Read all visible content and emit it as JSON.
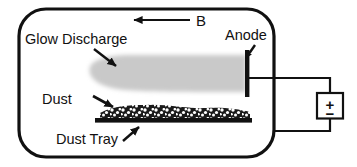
{
  "figure": {
    "background_color": "#ffffff",
    "line_color": "#111111",
    "glow_color": "#c9c9c9",
    "dust_color": "#1a1a1a"
  },
  "labels": {
    "glow_discharge": "Glow Discharge",
    "magnetic_field": "B",
    "anode": "Anode",
    "dust": "Dust",
    "dust_tray": "Dust Tray",
    "battery_plus": "+",
    "battery_minus": "−"
  },
  "components": {
    "chamber": {
      "name": "vacuum-chamber",
      "shape": "rounded-rectangle"
    },
    "glow_region": {
      "name": "glow-discharge-region",
      "shape": "bullet",
      "fill": "#c9c9c9"
    },
    "anode_bar": {
      "name": "anode-electrode",
      "shape": "vertical-bar",
      "fill": "#111111"
    },
    "dust_layer": {
      "name": "dust-layer",
      "shape": "speckled-mound"
    },
    "tray_bar": {
      "name": "dust-tray-bar",
      "shape": "horizontal-bar",
      "fill": "#111111"
    },
    "power_supply": {
      "name": "dc-power-supply",
      "shape": "square-battery"
    }
  },
  "arrows": [
    {
      "name": "magnetic-field-arrow",
      "label": "B",
      "direction": "left"
    },
    {
      "name": "glow-discharge-pointer",
      "direction": "down-right"
    },
    {
      "name": "anode-pointer",
      "direction": "down-left"
    },
    {
      "name": "dust-pointer",
      "direction": "down-right"
    },
    {
      "name": "dust-tray-pointer",
      "direction": "up-right"
    }
  ]
}
